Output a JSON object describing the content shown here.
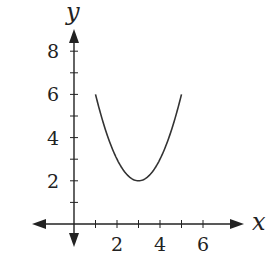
{
  "chart_data": {
    "type": "line",
    "title": "",
    "xlabel": "x",
    "ylabel": "y",
    "function": "y = (x - 3)^2 + 2",
    "x": [
      1,
      1.5,
      2,
      2.5,
      3,
      3.5,
      4,
      4.5,
      5
    ],
    "series": [
      {
        "name": "parabola",
        "values": [
          6,
          4.25,
          3,
          2.25,
          2,
          2.25,
          3,
          4.25,
          6
        ]
      }
    ],
    "vertex": [
      3,
      2
    ],
    "x_ticks": [
      1,
      2,
      3,
      4,
      5,
      6
    ],
    "x_tick_labels": [
      "2",
      "4",
      "6"
    ],
    "y_ticks": [
      1,
      2,
      3,
      4,
      5,
      6,
      7,
      8
    ],
    "y_tick_labels": [
      "2",
      "4",
      "6",
      "8"
    ],
    "xlim": [
      -1.5,
      7.8
    ],
    "ylim": [
      -1,
      9
    ],
    "grid": false,
    "legend": null,
    "colors": {
      "axis": "#222222",
      "curve": "#333333"
    }
  }
}
